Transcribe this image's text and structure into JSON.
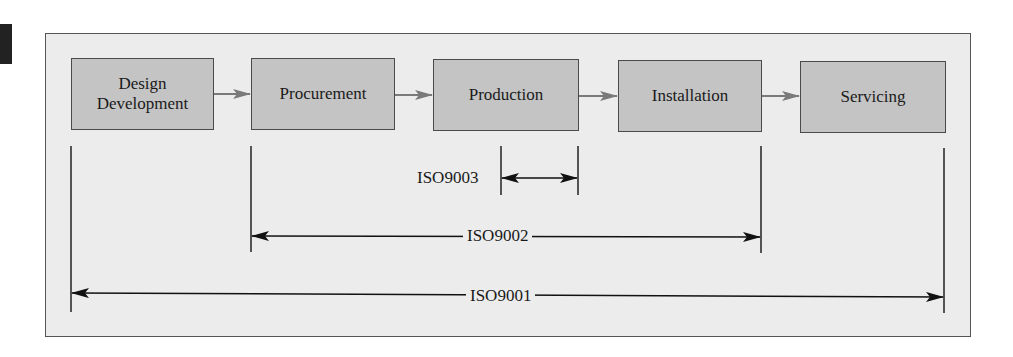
{
  "diagram": {
    "stages": [
      {
        "label": "Design\nDevelopment",
        "line1": "Design",
        "line2": "Development"
      },
      {
        "label": "Procurement"
      },
      {
        "label": "Production"
      },
      {
        "label": "Installation"
      },
      {
        "label": "Servicing"
      }
    ],
    "ranges": [
      {
        "label": "ISO9003",
        "from": "Production",
        "to": "Production (end)"
      },
      {
        "label": "ISO9002",
        "from": "Procurement",
        "to": "Installation"
      },
      {
        "label": "ISO9001",
        "from": "Design Development",
        "to": "Servicing"
      }
    ],
    "colors": {
      "background": "#ececec",
      "box_fill": "#c4c4c4",
      "box_border": "#4a4a4a",
      "flow_arrow": "#7a7a7a",
      "dimension_line": "#1a1a1a"
    }
  }
}
